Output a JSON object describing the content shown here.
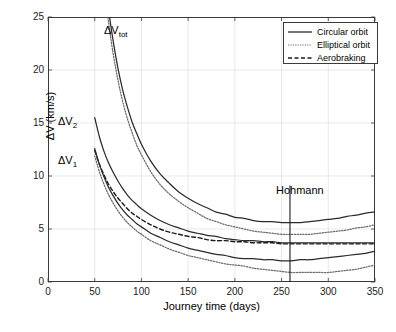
{
  "chart_data": {
    "type": "line",
    "title": "",
    "xlabel": "Journey time (days)",
    "ylabel": "ΔV (km/s)",
    "xlim": [
      0,
      350
    ],
    "ylim": [
      0,
      25
    ],
    "xticks": [
      0,
      50,
      100,
      150,
      200,
      250,
      300,
      350
    ],
    "yticks": [
      0,
      5,
      10,
      15,
      20,
      25
    ],
    "grid": true,
    "legend_position": "top-right",
    "legend": [
      {
        "label": "Circular orbit",
        "style": "solid"
      },
      {
        "label": "Elliptical orbit",
        "style": "dotted"
      },
      {
        "label": "Aerobraking",
        "style": "dashed"
      }
    ],
    "annotations": [
      {
        "text": "ΔV",
        "sub": "tot",
        "x": 58,
        "y": 24.0
      },
      {
        "text": "ΔV",
        "sub": "2",
        "x": 42,
        "y": 15.6
      },
      {
        "text": "ΔV",
        "sub": "1",
        "x": 42,
        "y": 11.9
      },
      {
        "text": "Hohmann",
        "x": 259,
        "y": 9.4
      }
    ],
    "hohmann_marker": {
      "label": "Hohmann",
      "x": 259,
      "y_top": 9.1,
      "y_bottom": 0
    },
    "x": [
      50,
      55,
      60,
      65,
      70,
      75,
      80,
      85,
      90,
      95,
      100,
      110,
      120,
      130,
      140,
      150,
      160,
      170,
      180,
      190,
      200,
      210,
      220,
      230,
      240,
      250,
      260,
      270,
      280,
      290,
      300,
      310,
      320,
      330,
      340,
      350
    ],
    "series": [
      {
        "name": "ΔV_tot circular orbit",
        "style": "solid",
        "color": "#2b2b2b",
        "values": [
          42.0,
          34.8,
          29.6,
          25.6,
          22.6,
          20.1,
          18.1,
          16.5,
          15.1,
          14.0,
          13.0,
          11.4,
          10.2,
          9.3,
          8.5,
          7.9,
          7.4,
          7.0,
          6.6,
          6.4,
          6.1,
          6.0,
          5.8,
          5.7,
          5.7,
          5.6,
          5.6,
          5.6,
          5.7,
          5.8,
          5.9,
          6.0,
          6.2,
          6.3,
          6.5,
          6.6
        ]
      },
      {
        "name": "ΔV_tot elliptical orbit",
        "style": "dotted",
        "color": "#6a6a6a",
        "values": [
          40.5,
          33.4,
          28.3,
          24.4,
          21.4,
          19.0,
          17.0,
          15.4,
          14.1,
          12.9,
          12.0,
          10.4,
          9.2,
          8.3,
          7.6,
          7.0,
          6.5,
          6.0,
          5.7,
          5.4,
          5.2,
          5.0,
          4.8,
          4.7,
          4.6,
          4.5,
          4.5,
          4.5,
          4.5,
          4.6,
          4.7,
          4.8,
          4.9,
          5.1,
          5.2,
          5.4
        ]
      },
      {
        "name": "ΔV_2 circular orbit",
        "style": "solid",
        "color": "#2b2b2b",
        "values": [
          15.5,
          13.7,
          12.3,
          11.2,
          10.3,
          9.5,
          8.8,
          8.2,
          7.7,
          7.3,
          6.9,
          6.3,
          5.8,
          5.4,
          5.1,
          4.8,
          4.6,
          4.4,
          4.3,
          4.1,
          4.0,
          3.9,
          3.9,
          3.8,
          3.8,
          3.7,
          3.7,
          3.7,
          3.7,
          3.7,
          3.7,
          3.7,
          3.7,
          3.7,
          3.7,
          3.7
        ]
      },
      {
        "name": "ΔV_2 aerobraking",
        "style": "dashed",
        "color": "#1a1a1a",
        "values": [
          12.4,
          11.1,
          10.1,
          9.2,
          8.5,
          7.9,
          7.4,
          6.9,
          6.5,
          6.2,
          5.9,
          5.4,
          5.0,
          4.7,
          4.5,
          4.3,
          4.2,
          4.0,
          3.9,
          3.9,
          3.8,
          3.8,
          3.7,
          3.7,
          3.7,
          3.6,
          3.6,
          3.6,
          3.6,
          3.6,
          3.6,
          3.6,
          3.6,
          3.6,
          3.6,
          3.6
        ]
      },
      {
        "name": "ΔV_1 circular orbit",
        "style": "solid",
        "color": "#2b2b2b",
        "values": [
          12.6,
          11.1,
          9.9,
          8.9,
          8.1,
          7.4,
          6.8,
          6.3,
          5.9,
          5.5,
          5.2,
          4.6,
          4.2,
          3.8,
          3.5,
          3.2,
          3.0,
          2.8,
          2.6,
          2.5,
          2.3,
          2.2,
          2.2,
          2.1,
          2.1,
          2.0,
          2.0,
          2.1,
          2.1,
          2.2,
          2.3,
          2.4,
          2.5,
          2.6,
          2.7,
          2.9
        ]
      },
      {
        "name": "ΔV_1 elliptical orbit",
        "style": "dotted",
        "color": "#6a6a6a",
        "values": [
          11.9,
          10.4,
          9.2,
          8.2,
          7.4,
          6.7,
          6.1,
          5.6,
          5.2,
          4.8,
          4.5,
          3.9,
          3.5,
          3.1,
          2.8,
          2.5,
          2.3,
          2.1,
          1.9,
          1.7,
          1.6,
          1.5,
          1.3,
          1.2,
          1.1,
          1.0,
          0.9,
          0.9,
          0.9,
          0.9,
          0.9,
          1.0,
          1.1,
          1.2,
          1.4,
          1.6
        ]
      }
    ]
  },
  "axes": {
    "ylabel": "ΔV (km/s)",
    "xlabel": "Journey time (days)",
    "xtick_labels": [
      "0",
      "50",
      "100",
      "150",
      "200",
      "250",
      "300",
      "350"
    ],
    "ytick_labels": [
      "0",
      "5",
      "10",
      "15",
      "20",
      "25"
    ]
  },
  "legend": {
    "circular": "Circular orbit",
    "elliptical": "Elliptical orbit",
    "aerobraking": "Aerobraking"
  },
  "annotations": {
    "dv_tot_base": "ΔV",
    "dv_tot_sub": "tot",
    "dv2_base": "ΔV",
    "dv2_sub": "2",
    "dv1_base": "ΔV",
    "dv1_sub": "1",
    "hohmann": "Hohmann"
  },
  "colors": {
    "circular": "#2b2b2b",
    "elliptical": "#6a6a6a",
    "aerobraking": "#1a1a1a",
    "grid": "#d8d8d8",
    "axis": "#3a3a3a"
  }
}
